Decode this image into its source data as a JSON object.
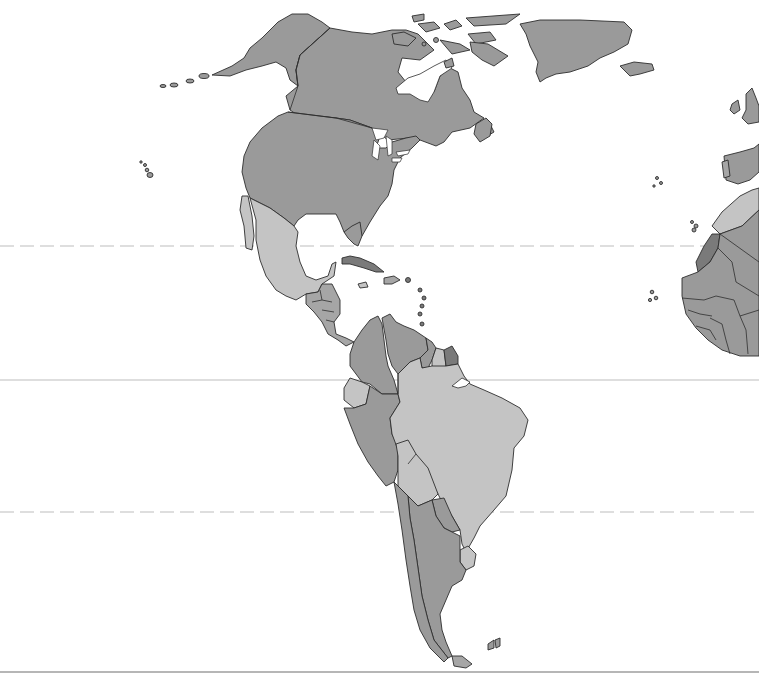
{
  "map": {
    "type": "political outline map",
    "region": "Americas",
    "labels": [],
    "colors": {
      "background": "#ffffff",
      "shade_dark": "#9a9a9a",
      "shade_mid": "#a6a6a6",
      "shade_light": "#c4c4c4",
      "shade_darkest": "#7a7a7a",
      "border": "#2e2e2e",
      "reference_line": "#bdbdbd"
    },
    "reference_lines": [
      {
        "name": "tropic-of-cancer",
        "y": 246,
        "style": "dashed"
      },
      {
        "name": "equator",
        "y": 380,
        "style": "solid"
      },
      {
        "name": "tropic-of-capricorn",
        "y": 512,
        "style": "dashed"
      },
      {
        "name": "bottom-frame-line",
        "y": 672,
        "style": "solid"
      }
    ],
    "regions": [
      {
        "name": "alaska",
        "shade": "shade_dark"
      },
      {
        "name": "canada",
        "shade": "shade_dark"
      },
      {
        "name": "greenland",
        "shade": "shade_dark"
      },
      {
        "name": "iceland",
        "shade": "shade_dark"
      },
      {
        "name": "usa",
        "shade": "shade_dark"
      },
      {
        "name": "mexico",
        "shade": "shade_light"
      },
      {
        "name": "central-america",
        "shade": "shade_mid"
      },
      {
        "name": "cuba",
        "shade": "shade_darkest"
      },
      {
        "name": "colombia",
        "shade": "shade_dark"
      },
      {
        "name": "venezuela",
        "shade": "shade_dark"
      },
      {
        "name": "guyana",
        "shade": "shade_dark"
      },
      {
        "name": "suriname",
        "shade": "shade_light"
      },
      {
        "name": "french-guiana",
        "shade": "shade_darkest"
      },
      {
        "name": "ecuador",
        "shade": "shade_light"
      },
      {
        "name": "peru",
        "shade": "shade_dark"
      },
      {
        "name": "brazil",
        "shade": "shade_light"
      },
      {
        "name": "bolivia",
        "shade": "shade_light"
      },
      {
        "name": "paraguay",
        "shade": "shade_dark"
      },
      {
        "name": "uruguay",
        "shade": "shade_light"
      },
      {
        "name": "argentina",
        "shade": "shade_dark"
      },
      {
        "name": "chile",
        "shade": "shade_dark"
      },
      {
        "name": "uk-ireland",
        "shade": "shade_dark"
      },
      {
        "name": "iberia",
        "shade": "shade_dark"
      },
      {
        "name": "morocco",
        "shade": "shade_light"
      },
      {
        "name": "western-sahara",
        "shade": "shade_darkest"
      },
      {
        "name": "west-africa",
        "shade": "shade_dark"
      }
    ]
  }
}
